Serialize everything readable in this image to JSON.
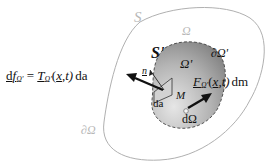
{
  "diagram": {
    "outer_domain": {
      "label": "Ω",
      "surface_label": "S",
      "boundary_label": "∂Ω"
    },
    "inner_domain": {
      "label": "Ω'",
      "surface_label": "S'",
      "boundary_label": "∂Ω'"
    },
    "point": {
      "label": "M"
    },
    "normal": {
      "label": "n"
    },
    "area_element": {
      "label": "da"
    },
    "volume_element": {
      "label": "dΩ"
    },
    "surface_force": {
      "lhs_d": "d",
      "lhs_f": "f",
      "lhs_sub": "Ω'",
      "equals": "=",
      "T": "T",
      "T_sub": "Ω'",
      "args_open": "(",
      "x": "x",
      "args_rest": ",t)",
      "da": "da"
    },
    "body_force": {
      "F": "F",
      "F_sub": "Ω'",
      "args_open": "(",
      "x": "x",
      "args_rest": ",t)",
      "dm": "dm"
    },
    "colors": {
      "outer_fill": "#ffffff",
      "outer_stroke": "#b0b0b0",
      "inner_fill_light": "#e2e2e2",
      "inner_fill_dark": "#8c8c8c",
      "inner_stroke": "#444444",
      "arrow": "#111111"
    }
  }
}
